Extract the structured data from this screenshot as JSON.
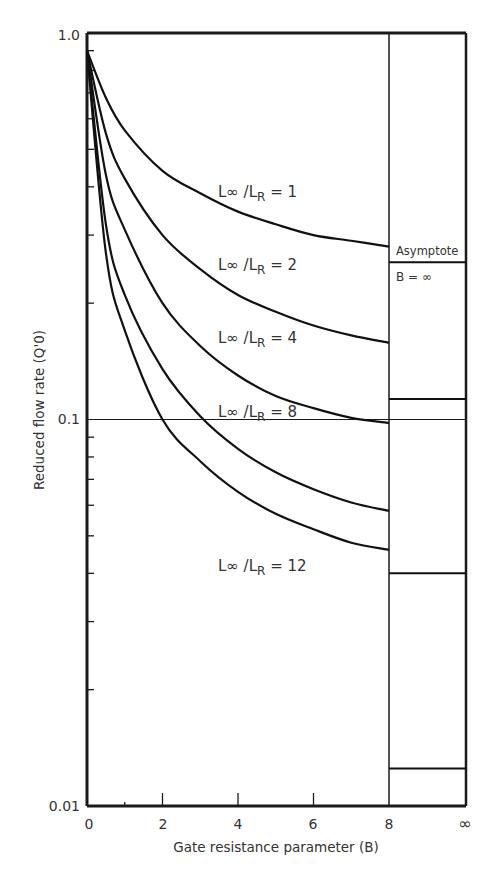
{
  "chart_data": {
    "type": "line",
    "title": "",
    "xlabel": "Gate resistance parameter (B)",
    "ylabel": "Reduced flow rate (Q'0)",
    "yscale": "log",
    "ylim": [
      0.01,
      1.0
    ],
    "xlim": [
      0,
      8
    ],
    "x_ticks": [
      "0",
      "2",
      "4",
      "6",
      "8",
      "∞"
    ],
    "y_ticks": [
      "1.0",
      "0.1",
      "0.01"
    ],
    "grid": false,
    "reference_line": {
      "y": 0.1
    },
    "asymptote_panel": {
      "label_line1": "Asymptote",
      "label_line2": "B = ∞",
      "x_label": "∞"
    },
    "series": [
      {
        "name": "L∞/LR = 1",
        "label_prefix": "L∞ /L",
        "label_sub": "R",
        "label_suffix": " = 1",
        "x": [
          0,
          0.5,
          1,
          2,
          3,
          4,
          5,
          6,
          7,
          8
        ],
        "values": [
          0.9,
          0.68,
          0.56,
          0.44,
          0.385,
          0.345,
          0.32,
          0.3,
          0.29,
          0.28
        ],
        "asymptote": 0.255
      },
      {
        "name": "L∞/LR = 2",
        "label_prefix": "L∞ /L",
        "label_sub": "R",
        "label_suffix": " = 2",
        "x": [
          0,
          0.5,
          1,
          2,
          3,
          4,
          5,
          6,
          7,
          8
        ],
        "values": [
          0.9,
          0.55,
          0.42,
          0.3,
          0.245,
          0.21,
          0.19,
          0.175,
          0.165,
          0.158
        ],
        "asymptote": null
      },
      {
        "name": "L∞/LR = 4",
        "label_prefix": "L∞ /L",
        "label_sub": "R",
        "label_suffix": " = 4",
        "x": [
          0,
          0.5,
          1,
          2,
          3,
          4,
          5,
          6,
          7,
          8
        ],
        "values": [
          0.9,
          0.43,
          0.31,
          0.2,
          0.155,
          0.13,
          0.115,
          0.107,
          0.101,
          0.098
        ],
        "asymptote": 0.113
      },
      {
        "name": "L∞/LR = 8",
        "label_prefix": "L∞ /L",
        "label_sub": "R",
        "label_suffix": " = 8",
        "x": [
          0,
          0.5,
          1,
          2,
          3,
          4,
          5,
          6,
          7,
          8
        ],
        "values": [
          0.9,
          0.32,
          0.21,
          0.135,
          0.102,
          0.084,
          0.073,
          0.066,
          0.061,
          0.058
        ],
        "asymptote": 0.04
      },
      {
        "name": "L∞/LR = 12",
        "label_prefix": "L∞ /L",
        "label_sub": "R",
        "label_suffix": " = 12",
        "x": [
          0,
          0.5,
          1,
          2,
          3,
          4,
          5,
          6,
          7,
          8
        ],
        "values": [
          0.9,
          0.27,
          0.17,
          0.1,
          0.078,
          0.065,
          0.057,
          0.052,
          0.048,
          0.046
        ],
        "asymptote": 0.0125
      }
    ]
  }
}
